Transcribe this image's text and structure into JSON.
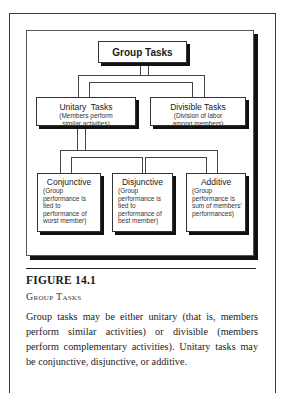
{
  "diagram": {
    "root": {
      "label": "Group Tasks"
    },
    "level2": [
      {
        "label": "Unitary  Tasks",
        "description": "(Members perform similar activities)"
      },
      {
        "label": "Divisible Tasks",
        "description": "(Division of labor among members)"
      }
    ],
    "level3": [
      {
        "label": "Conjunctive",
        "description": "(Group performance is tied to performance of worst member)"
      },
      {
        "label": "Disjunctive",
        "description": "(Group performance is tied to performance of best member)"
      },
      {
        "label": "Additive",
        "description": "(Group performance is sum of members' performances)"
      }
    ]
  },
  "figure": {
    "number_label": "FIGURE 14.1",
    "title": "Group Tasks",
    "caption": "Group tasks may be either unitary (that is, members perform similar activities) or divisible (members perform complementary activities). Unitary tasks may be conjunctive, disjunctive, or additive."
  }
}
